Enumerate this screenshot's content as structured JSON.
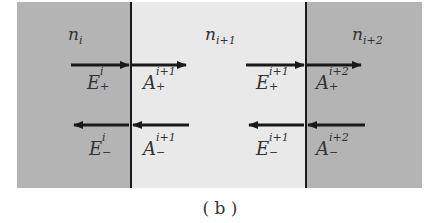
{
  "diagram": {
    "caption": "( b )",
    "media": [
      {
        "label_base": "n",
        "label_sub": "i",
        "shade": "#b4b4b4"
      },
      {
        "label_base": "n",
        "label_sub": "i+1",
        "shade": "#e9e9e9"
      },
      {
        "label_base": "n",
        "label_sub": "i+2",
        "shade": "#b4b4b4"
      }
    ],
    "symbols": {
      "E_plus_i": {
        "base": "E",
        "sup": "i",
        "sub": "+"
      },
      "A_plus_i1": {
        "base": "A",
        "sup": "i+1",
        "sub": "+"
      },
      "E_plus_i1": {
        "base": "E",
        "sup": "i+1",
        "sub": "+"
      },
      "A_plus_i2": {
        "base": "A",
        "sup": "i+2",
        "sub": "+"
      },
      "E_minus_i": {
        "base": "E",
        "sup": "i",
        "sub": "−"
      },
      "A_minus_i1": {
        "base": "A",
        "sup": "i+1",
        "sub": "−"
      },
      "E_minus_i1": {
        "base": "E",
        "sup": "i+1",
        "sub": "−"
      },
      "A_minus_i2": {
        "base": "A",
        "sup": "i+2",
        "sub": "−"
      }
    }
  }
}
